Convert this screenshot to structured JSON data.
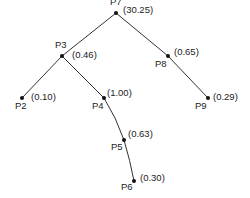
{
  "diagram": {
    "type": "tree",
    "nodes": [
      {
        "id": "P7",
        "label": "P7",
        "value": "(30.25)"
      },
      {
        "id": "P3",
        "label": "P3",
        "value": "(0.46)"
      },
      {
        "id": "P8",
        "label": "P8",
        "value": "(0.65)"
      },
      {
        "id": "P2",
        "label": "P2",
        "value": "(0.10)"
      },
      {
        "id": "P4",
        "label": "P4",
        "value": "(1.00)"
      },
      {
        "id": "P9",
        "label": "P9",
        "value": "(0.29)"
      },
      {
        "id": "P5",
        "label": "P5",
        "value": "(0.63)"
      },
      {
        "id": "P6",
        "label": "P6",
        "value": "(0.30)"
      }
    ],
    "edges": [
      {
        "from": "P7",
        "to": "P3"
      },
      {
        "from": "P7",
        "to": "P8"
      },
      {
        "from": "P3",
        "to": "P2"
      },
      {
        "from": "P3",
        "to": "P4"
      },
      {
        "from": "P8",
        "to": "P9"
      },
      {
        "from": "P4",
        "to": "P5"
      },
      {
        "from": "P5",
        "to": "P6"
      }
    ]
  }
}
